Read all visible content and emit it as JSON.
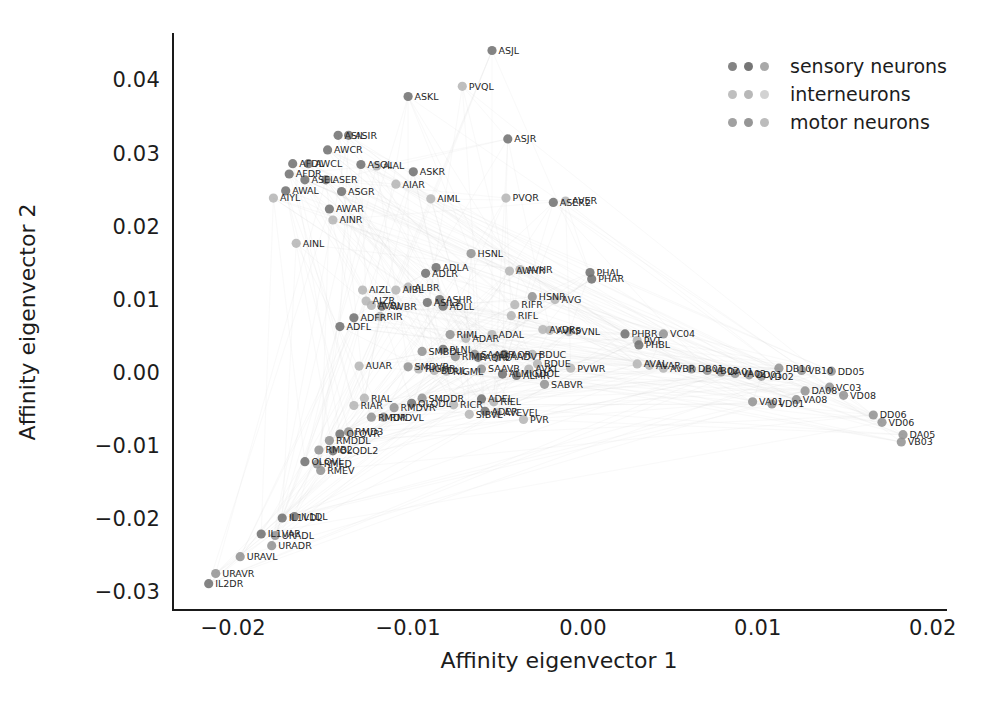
{
  "chart_data": {
    "type": "scatter",
    "title": "",
    "xlabel": "Affinity eigenvector 1",
    "ylabel": "Affinity eigenvector 2",
    "xlim": [
      -0.0235,
      0.0207
    ],
    "ylim": [
      -0.0325,
      0.0465
    ],
    "xticks": [
      -0.02,
      -0.01,
      0.0,
      0.01,
      0.02
    ],
    "xtick_labels": [
      "−0.02",
      "−0.01",
      "0.00",
      "0.01",
      "0.02"
    ],
    "yticks": [
      -0.03,
      -0.02,
      -0.01,
      0.0,
      0.01,
      0.02,
      0.03,
      0.04
    ],
    "ytick_labels": [
      "−0.03",
      "−0.02",
      "−0.01",
      "0.00",
      "0.01",
      "0.02",
      "0.03",
      "0.04"
    ],
    "grid": false,
    "legend_position": "upper right",
    "point_color": "#8d8d8d",
    "label_color": "#262626",
    "edge_color": "#cfcfcf",
    "series": [
      {
        "name": "sensory neurons",
        "color": "#6f6f6f"
      },
      {
        "name": "interneurons",
        "color": "#b4b4b4"
      },
      {
        "name": "motor neurons",
        "color": "#909090"
      }
    ],
    "points": [
      {
        "label": "ASJL",
        "x": -0.0052,
        "y": 0.0441,
        "g": "sensory"
      },
      {
        "label": "PVQL",
        "x": -0.0069,
        "y": 0.0392,
        "g": "inter"
      },
      {
        "label": "ASKL",
        "x": -0.01,
        "y": 0.0378,
        "g": "sensory"
      },
      {
        "label": "ASIL",
        "x": -0.014,
        "y": 0.0325,
        "g": "sensory"
      },
      {
        "label": "ASIR",
        "x": -0.0134,
        "y": 0.0325,
        "g": "sensory"
      },
      {
        "label": "ASJR",
        "x": -0.0043,
        "y": 0.032,
        "g": "sensory"
      },
      {
        "label": "AWCR",
        "x": -0.0146,
        "y": 0.0305,
        "g": "sensory"
      },
      {
        "label": "AFDL",
        "x": -0.0166,
        "y": 0.0286,
        "g": "sensory"
      },
      {
        "label": "AWCL",
        "x": -0.0157,
        "y": 0.0286,
        "g": "sensory"
      },
      {
        "label": "ASGL",
        "x": -0.0127,
        "y": 0.0285,
        "g": "sensory"
      },
      {
        "label": "AIAL",
        "x": -0.0118,
        "y": 0.0283,
        "g": "inter"
      },
      {
        "label": "ASKR",
        "x": -0.0097,
        "y": 0.0275,
        "g": "sensory"
      },
      {
        "label": "AFDR",
        "x": -0.0168,
        "y": 0.0272,
        "g": "sensory"
      },
      {
        "label": "ASEL",
        "x": -0.0159,
        "y": 0.0264,
        "g": "sensory"
      },
      {
        "label": "ASER",
        "x": -0.0147,
        "y": 0.0264,
        "g": "sensory"
      },
      {
        "label": "AIAR",
        "x": -0.0107,
        "y": 0.0258,
        "g": "inter"
      },
      {
        "label": "AWAL",
        "x": -0.017,
        "y": 0.0249,
        "g": "sensory"
      },
      {
        "label": "ASGR",
        "x": -0.0138,
        "y": 0.0248,
        "g": "sensory"
      },
      {
        "label": "AIYL",
        "x": -0.0177,
        "y": 0.0239,
        "g": "inter"
      },
      {
        "label": "AIML",
        "x": -0.0087,
        "y": 0.0238,
        "g": "inter"
      },
      {
        "label": "AWAR",
        "x": -0.0145,
        "y": 0.0224,
        "g": "sensory"
      },
      {
        "label": "PVQR",
        "x": -0.0044,
        "y": 0.0239,
        "g": "inter"
      },
      {
        "label": "ASER2",
        "x": -0.0017,
        "y": 0.0233,
        "g": "sensory"
      },
      {
        "label": "AVER",
        "x": -0.001,
        "y": 0.0235,
        "g": "inter"
      },
      {
        "label": "AINR",
        "x": -0.0143,
        "y": 0.0209,
        "g": "inter"
      },
      {
        "label": "AINL",
        "x": -0.0164,
        "y": 0.0177,
        "g": "inter"
      },
      {
        "label": "HSNL",
        "x": -0.0064,
        "y": 0.0163,
        "g": "motor"
      },
      {
        "label": "ADLA",
        "x": -0.0084,
        "y": 0.0144,
        "g": "sensory"
      },
      {
        "label": "ADLR",
        "x": -0.009,
        "y": 0.0136,
        "g": "sensory"
      },
      {
        "label": "AVHR",
        "x": -0.0036,
        "y": 0.0141,
        "g": "inter"
      },
      {
        "label": "AWHR",
        "x": -0.0042,
        "y": 0.0139,
        "g": "inter"
      },
      {
        "label": "PHAL",
        "x": 0.0004,
        "y": 0.0137,
        "g": "sensory"
      },
      {
        "label": "PHAR",
        "x": 0.0005,
        "y": 0.0128,
        "g": "sensory"
      },
      {
        "label": "AIZL",
        "x": -0.0126,
        "y": 0.0113,
        "g": "inter"
      },
      {
        "label": "AIBL",
        "x": -0.0107,
        "y": 0.0113,
        "g": "inter"
      },
      {
        "label": "ALBR",
        "x": -0.01,
        "y": 0.0117,
        "g": "inter"
      },
      {
        "label": "AIZR",
        "x": -0.0124,
        "y": 0.0098,
        "g": "inter"
      },
      {
        "label": "AVBL",
        "x": -0.0121,
        "y": 0.0092,
        "g": "inter"
      },
      {
        "label": "AWBR",
        "x": -0.0115,
        "y": 0.0091,
        "g": "sensory"
      },
      {
        "label": "ASIL2",
        "x": -0.0089,
        "y": 0.0096,
        "g": "sensory"
      },
      {
        "label": "ASHR",
        "x": -0.0082,
        "y": 0.01,
        "g": "sensory"
      },
      {
        "label": "ADLL",
        "x": -0.008,
        "y": 0.0091,
        "g": "sensory"
      },
      {
        "label": "HSNR",
        "x": -0.0029,
        "y": 0.0104,
        "g": "motor"
      },
      {
        "label": "AVG",
        "x": -0.0016,
        "y": 0.01,
        "g": "inter"
      },
      {
        "label": "RIFR",
        "x": -0.0039,
        "y": 0.0093,
        "g": "inter"
      },
      {
        "label": "ADFR",
        "x": -0.0131,
        "y": 0.0075,
        "g": "sensory"
      },
      {
        "label": "RIR",
        "x": -0.0116,
        "y": 0.0077,
        "g": "inter"
      },
      {
        "label": "ADFL",
        "x": -0.0139,
        "y": 0.0063,
        "g": "sensory"
      },
      {
        "label": "RIFL",
        "x": -0.0041,
        "y": 0.0078,
        "g": "inter"
      },
      {
        "label": "RIML",
        "x": -0.0076,
        "y": 0.0052,
        "g": "motor"
      },
      {
        "label": "ADAR",
        "x": -0.0067,
        "y": 0.0047,
        "g": "inter"
      },
      {
        "label": "ADAL",
        "x": -0.0052,
        "y": 0.0052,
        "g": "inter"
      },
      {
        "label": "AVDR",
        "x": -0.0023,
        "y": 0.0059,
        "g": "inter"
      },
      {
        "label": "AVKS",
        "x": -0.0019,
        "y": 0.0058,
        "g": "inter"
      },
      {
        "label": "PVNL",
        "x": -0.0008,
        "y": 0.0056,
        "g": "inter"
      },
      {
        "label": "PHBR",
        "x": 0.0024,
        "y": 0.0053,
        "g": "sensory"
      },
      {
        "label": "VC04",
        "x": 0.0046,
        "y": 0.0053,
        "g": "motor"
      },
      {
        "label": "PVT",
        "x": 0.0031,
        "y": 0.0044,
        "g": "inter"
      },
      {
        "label": "PHBL",
        "x": 0.0032,
        "y": 0.0038,
        "g": "sensory"
      },
      {
        "label": "SMBDL",
        "x": -0.0092,
        "y": 0.0029,
        "g": "motor"
      },
      {
        "label": "PLNL",
        "x": -0.008,
        "y": 0.0032,
        "g": "sensory"
      },
      {
        "label": "RIMB",
        "x": -0.0073,
        "y": 0.0022,
        "g": "motor"
      },
      {
        "label": "SAADR",
        "x": -0.0062,
        "y": 0.0025,
        "g": "motor"
      },
      {
        "label": "SAADVT",
        "x": -0.0049,
        "y": 0.0022,
        "g": "motor"
      },
      {
        "label": "AQR",
        "x": -0.0045,
        "y": 0.0025,
        "g": "sensory"
      },
      {
        "label": "BDUC",
        "x": -0.0029,
        "y": 0.0025,
        "g": "inter"
      },
      {
        "label": "AQRL",
        "x": -0.006,
        "y": 0.0021,
        "g": "sensory"
      },
      {
        "label": "AUAR",
        "x": -0.0128,
        "y": 0.0009,
        "g": "inter"
      },
      {
        "label": "SMDVR",
        "x": -0.01,
        "y": 0.0008,
        "g": "motor"
      },
      {
        "label": "RIGHR",
        "x": -0.0094,
        "y": 0.0005,
        "g": "inter"
      },
      {
        "label": "BDUL",
        "x": -0.0085,
        "y": 0.0003,
        "g": "inter"
      },
      {
        "label": "RIGML",
        "x": -0.0078,
        "y": 0.0002,
        "g": "inter"
      },
      {
        "label": "SAAVB",
        "x": -0.0058,
        "y": 0.0005,
        "g": "motor"
      },
      {
        "label": "AVKL",
        "x": -0.0031,
        "y": 0.0005,
        "g": "inter"
      },
      {
        "label": "BDUE",
        "x": -0.0026,
        "y": 0.0012,
        "g": "inter"
      },
      {
        "label": "PVWR",
        "x": -0.0007,
        "y": 0.0006,
        "g": "inter"
      },
      {
        "label": "ALMR",
        "x": -0.0038,
        "y": -0.0004,
        "g": "sensory"
      },
      {
        "label": "ALMIGDOL",
        "x": -0.0046,
        "y": -0.0002,
        "g": "sensory"
      },
      {
        "label": "SABVR",
        "x": -0.0022,
        "y": -0.0016,
        "g": "motor"
      },
      {
        "label": "RIAL",
        "x": -0.0125,
        "y": -0.0035,
        "g": "inter"
      },
      {
        "label": "RIAR",
        "x": -0.0131,
        "y": -0.0045,
        "g": "inter"
      },
      {
        "label": "SMDDR",
        "x": -0.0092,
        "y": -0.0035,
        "g": "motor"
      },
      {
        "label": "OLQDL",
        "x": -0.0098,
        "y": -0.0042,
        "g": "sensory"
      },
      {
        "label": "ADEL",
        "x": -0.0058,
        "y": -0.0036,
        "g": "sensory"
      },
      {
        "label": "RIEL",
        "x": -0.0051,
        "y": -0.004,
        "g": "inter"
      },
      {
        "label": "RICR",
        "x": -0.0074,
        "y": -0.0044,
        "g": "inter"
      },
      {
        "label": "RMDVR",
        "x": -0.0108,
        "y": -0.0048,
        "g": "motor"
      },
      {
        "label": "ADER",
        "x": -0.0056,
        "y": -0.0053,
        "g": "sensory"
      },
      {
        "label": "AVEVEL",
        "x": -0.0049,
        "y": -0.0055,
        "g": "inter"
      },
      {
        "label": "SIBVL",
        "x": -0.0065,
        "y": -0.0057,
        "g": "inter"
      },
      {
        "label": "PVR",
        "x": -0.0034,
        "y": -0.0064,
        "g": "inter"
      },
      {
        "label": "RMDR",
        "x": -0.0121,
        "y": -0.0061,
        "g": "motor"
      },
      {
        "label": "RMDVL",
        "x": -0.0114,
        "y": -0.0061,
        "g": "motor"
      },
      {
        "label": "RMD3",
        "x": -0.0134,
        "y": -0.0081,
        "g": "motor"
      },
      {
        "label": "OLQVR",
        "x": -0.0139,
        "y": -0.0084,
        "g": "sensory"
      },
      {
        "label": "RMDDL",
        "x": -0.0145,
        "y": -0.0093,
        "g": "motor"
      },
      {
        "label": "RMB2",
        "x": -0.0151,
        "y": -0.0106,
        "g": "motor"
      },
      {
        "label": "OLQDL2",
        "x": -0.0143,
        "y": -0.0107,
        "g": "sensory"
      },
      {
        "label": "OLQVL",
        "x": -0.0159,
        "y": -0.0122,
        "g": "sensory"
      },
      {
        "label": "RMED",
        "x": -0.0152,
        "y": -0.0125,
        "g": "motor"
      },
      {
        "label": "RMEV",
        "x": -0.015,
        "y": -0.0134,
        "g": "motor"
      },
      {
        "label": "IL1DL",
        "x": -0.0165,
        "y": -0.0197,
        "g": "sensory"
      },
      {
        "label": "IL1VDL",
        "x": -0.0172,
        "y": -0.0199,
        "g": "sensory"
      },
      {
        "label": "IL1VAR",
        "x": -0.0184,
        "y": -0.0221,
        "g": "sensory"
      },
      {
        "label": "URADL",
        "x": -0.0176,
        "y": -0.0223,
        "g": "motor"
      },
      {
        "label": "URADR",
        "x": -0.0178,
        "y": -0.0237,
        "g": "motor"
      },
      {
        "label": "URAVL",
        "x": -0.0196,
        "y": -0.0252,
        "g": "motor"
      },
      {
        "label": "URAVR",
        "x": -0.021,
        "y": -0.0275,
        "g": "motor"
      },
      {
        "label": "IL2DR",
        "x": -0.0214,
        "y": -0.0289,
        "g": "sensory"
      },
      {
        "label": "AVAL",
        "x": 0.0031,
        "y": 0.0012,
        "g": "inter"
      },
      {
        "label": "AVAR",
        "x": 0.0038,
        "y": 0.001,
        "g": "inter"
      },
      {
        "label": "AVBR",
        "x": 0.0046,
        "y": 0.0006,
        "g": "inter"
      },
      {
        "label": "DB01",
        "x": 0.0062,
        "y": 0.0005,
        "g": "motor"
      },
      {
        "label": "VB02",
        "x": 0.0071,
        "y": 0.0003,
        "g": "motor"
      },
      {
        "label": "DA01",
        "x": 0.0079,
        "y": 0.0001,
        "g": "motor"
      },
      {
        "label": "VA02",
        "x": 0.0087,
        "y": -0.0001,
        "g": "motor"
      },
      {
        "label": "DD01",
        "x": 0.0095,
        "y": -0.0003,
        "g": "motor"
      },
      {
        "label": "VD02",
        "x": 0.0102,
        "y": -0.0005,
        "g": "motor"
      },
      {
        "label": "DB10",
        "x": 0.0112,
        "y": 0.0006,
        "g": "motor"
      },
      {
        "label": "VB10",
        "x": 0.0125,
        "y": 0.0003,
        "g": "motor"
      },
      {
        "label": "DD05",
        "x": 0.0142,
        "y": 0.0002,
        "g": "motor"
      },
      {
        "label": "VC03",
        "x": 0.0141,
        "y": -0.002,
        "g": "motor"
      },
      {
        "label": "DA08",
        "x": 0.0127,
        "y": -0.0025,
        "g": "motor"
      },
      {
        "label": "VD08",
        "x": 0.0149,
        "y": -0.0031,
        "g": "motor"
      },
      {
        "label": "VA08",
        "x": 0.0122,
        "y": -0.0037,
        "g": "motor"
      },
      {
        "label": "VD01",
        "x": 0.0108,
        "y": -0.0043,
        "g": "motor"
      },
      {
        "label": "VA01",
        "x": 0.0097,
        "y": -0.004,
        "g": "motor"
      },
      {
        "label": "DA05",
        "x": 0.0183,
        "y": -0.0085,
        "g": "motor"
      },
      {
        "label": "VB03",
        "x": 0.0182,
        "y": -0.0095,
        "g": "motor"
      },
      {
        "label": "DD06",
        "x": 0.0166,
        "y": -0.0058,
        "g": "motor"
      },
      {
        "label": "VD06",
        "x": 0.0171,
        "y": -0.0068,
        "g": "motor"
      }
    ]
  },
  "legend": {
    "items": [
      {
        "label": "sensory neurons",
        "marker_name": "sensory-marker"
      },
      {
        "label": "interneurons",
        "marker_name": "inter-marker"
      },
      {
        "label": "motor neurons",
        "marker_name": "motor-marker"
      }
    ]
  }
}
